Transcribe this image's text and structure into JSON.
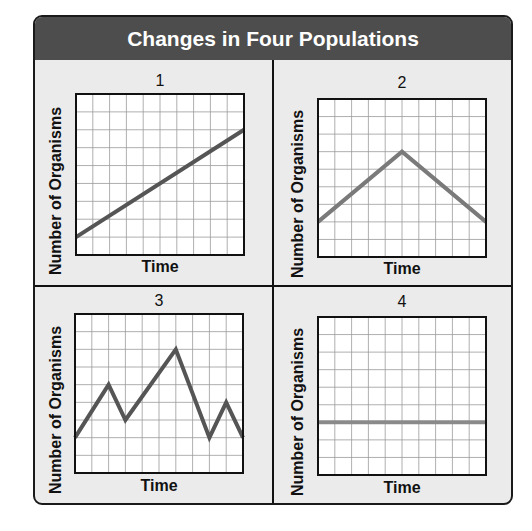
{
  "title": "Changes in Four Populations",
  "colors": {
    "header_bg": "#4d4d4d",
    "header_text": "#ffffff",
    "panel_bg": "#ebebeb",
    "grid": "#9a9a9a",
    "line_1": "#555555",
    "line_2": "#7a7a7a",
    "line_3": "#555555",
    "line_4": "#8a8a8a"
  },
  "panels": [
    {
      "number": "1",
      "xlabel": "Time",
      "ylabel": "Number of Organisms"
    },
    {
      "number": "2",
      "xlabel": "Time",
      "ylabel": "Number of Organisms"
    },
    {
      "number": "3",
      "xlabel": "Time",
      "ylabel": "Number of Organisms"
    },
    {
      "number": "4",
      "xlabel": "Time",
      "ylabel": "Number of Organisms"
    }
  ],
  "chart_data": [
    {
      "type": "line",
      "title": "1",
      "xlabel": "Time",
      "ylabel": "Number of Organisms",
      "grid": true,
      "xlim": [
        0,
        10
      ],
      "ylim": [
        0,
        9
      ],
      "x": [
        0,
        10
      ],
      "values": [
        1,
        7
      ],
      "trend": "steady increase"
    },
    {
      "type": "line",
      "title": "2",
      "xlabel": "Time",
      "ylabel": "Number of Organisms",
      "grid": true,
      "xlim": [
        0,
        10
      ],
      "ylim": [
        0,
        9
      ],
      "x": [
        0,
        5,
        10
      ],
      "values": [
        2,
        6,
        2
      ],
      "trend": "increase then decrease"
    },
    {
      "type": "line",
      "title": "3",
      "xlabel": "Time",
      "ylabel": "Number of Organisms",
      "grid": true,
      "xlim": [
        0,
        10
      ],
      "ylim": [
        0,
        9
      ],
      "x": [
        0,
        2,
        3,
        6,
        8,
        9,
        10
      ],
      "values": [
        2,
        5,
        3,
        7,
        2,
        4,
        2
      ],
      "trend": "fluctuating"
    },
    {
      "type": "line",
      "title": "4",
      "xlabel": "Time",
      "ylabel": "Number of Organisms",
      "grid": true,
      "xlim": [
        0,
        10
      ],
      "ylim": [
        0,
        9
      ],
      "x": [
        0,
        10
      ],
      "values": [
        3,
        3
      ],
      "trend": "constant"
    }
  ]
}
